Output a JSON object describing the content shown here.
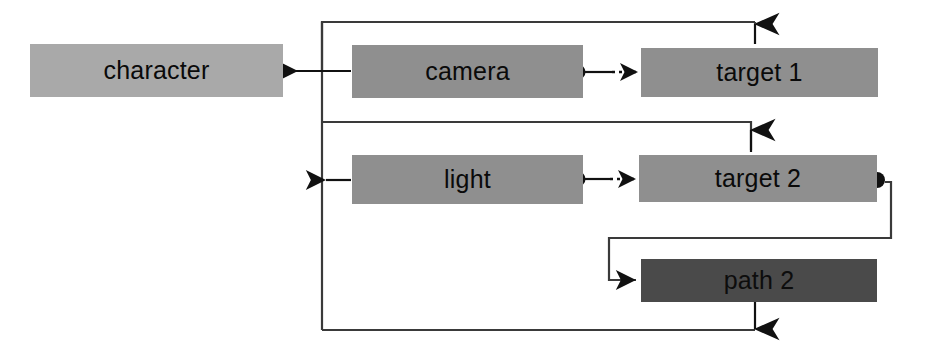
{
  "diagram": {
    "background_color": "#ffffff",
    "line_color": "#333333",
    "arrow_color": "#111111",
    "nodes": [
      {
        "id": "character",
        "label": "character",
        "fill": "#a9a9a9",
        "x": 30,
        "y": 44,
        "width": 253,
        "height": 53
      },
      {
        "id": "camera",
        "label": "camera",
        "fill": "#8f8f8f",
        "x": 352,
        "y": 45,
        "width": 231,
        "height": 53
      },
      {
        "id": "target1",
        "label": "target 1",
        "fill": "#8f8f8f",
        "x": 641,
        "y": 48,
        "width": 237,
        "height": 49
      },
      {
        "id": "light",
        "label": "light",
        "fill": "#8f8f8f",
        "x": 352,
        "y": 155,
        "width": 231,
        "height": 49
      },
      {
        "id": "target2",
        "label": "target 2",
        "fill": "#8f8f8f",
        "x": 639,
        "y": 155,
        "width": 238,
        "height": 47
      },
      {
        "id": "path2",
        "label": "path 2",
        "fill": "#4a4a4a",
        "x": 641,
        "y": 259,
        "width": 236,
        "height": 43
      }
    ],
    "edges": [
      {
        "id": "camera-to-character",
        "from": "camera",
        "to": "character",
        "style": "solid",
        "marker": "arrow-left"
      },
      {
        "id": "bus-to-character",
        "from": "bus",
        "to": "character",
        "style": "solid",
        "marker": "arrow-left"
      },
      {
        "id": "camera-to-target1",
        "from": "camera",
        "to": "target 1",
        "style": "dotted",
        "marker": "arrow-right",
        "source_decoration": "filled-circle"
      },
      {
        "id": "target1-to-bus",
        "from": "target 1",
        "to": "bus",
        "style": "solid",
        "marker": "arrow-up"
      },
      {
        "id": "light-to-character",
        "from": "light",
        "to": "character",
        "style": "solid",
        "marker": "arrow-left"
      },
      {
        "id": "light-to-target2",
        "from": "light",
        "to": "target 2",
        "style": "dotted",
        "marker": "arrow-right",
        "source_decoration": "filled-circle"
      },
      {
        "id": "target2-to-bus",
        "from": "target 2",
        "to": "bus",
        "style": "solid",
        "marker": "arrow-up"
      },
      {
        "id": "target2-to-path2",
        "from": "target 2",
        "to": "path 2",
        "style": "solid",
        "marker": "arrow-right",
        "source_decoration": "filled-circle"
      },
      {
        "id": "path2-to-bus",
        "from": "path 2",
        "to": "bus",
        "style": "solid",
        "marker": "arrow-down"
      }
    ]
  }
}
